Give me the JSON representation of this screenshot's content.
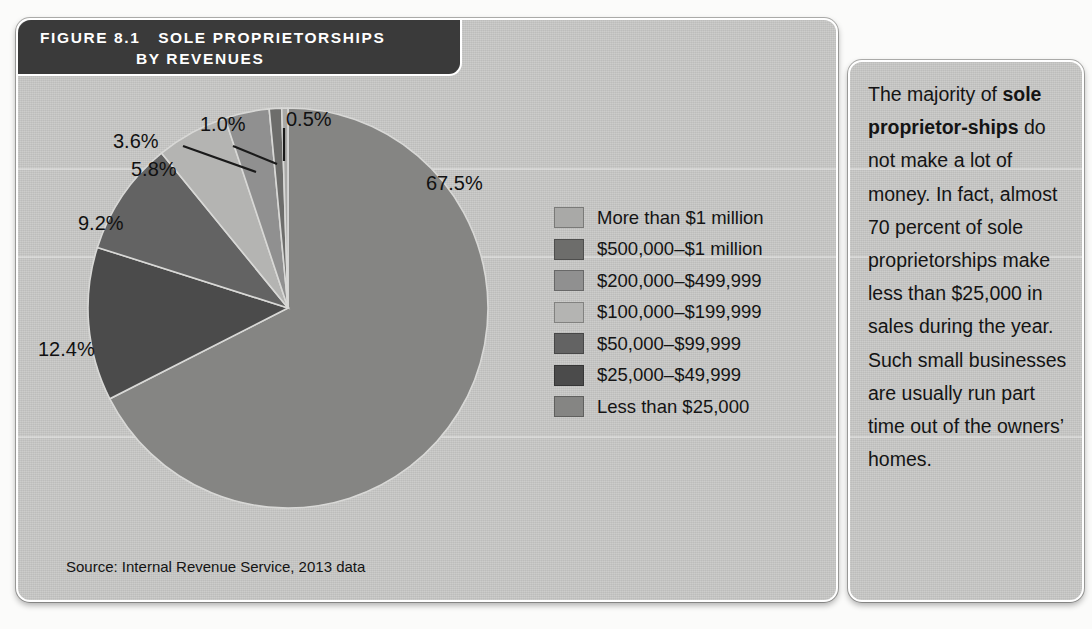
{
  "figure": {
    "label": "FIGURE 8.1",
    "title_line1": "SOLE PROPRIETORSHIPS",
    "title_line2": "BY REVENUES",
    "source": "Source: Internal Revenue Service, 2013 data"
  },
  "caption": {
    "part1": "The majority of ",
    "bold": "sole proprietor-ships",
    "part2": " do not make a lot of money. In fact, almost 70 percent of sole proprietorships make less than $25,000 in sales during the year. Such small businesses are usually run part time out of the owners’ homes."
  },
  "chart_data": {
    "type": "pie",
    "source": "Source: Internal Revenue Service, 2013 data",
    "legend_position": "right",
    "unit": "percent",
    "categories": [
      "More than $1 million",
      "$500,000–$1 million",
      "$200,000–$499,999",
      "$100,000–$199,999",
      "$50,000–$99,999",
      "$25,000–$49,999",
      "Less than $25,000"
    ],
    "values": [
      0.5,
      1.0,
      3.6,
      5.8,
      9.2,
      12.4,
      67.5
    ],
    "labels": [
      "0.5%",
      "1.0%",
      "3.6%",
      "5.8%",
      "9.2%",
      "12.4%",
      "67.5%"
    ],
    "colors": [
      "#a9a9a7",
      "#6d6d6b",
      "#909090",
      "#b4b4b2",
      "#636363",
      "#4b4b4b",
      "#858583"
    ],
    "slice_order_clockwise_from_top": [
      {
        "category": "Less than $25,000",
        "value": 67.5,
        "color": "#858583"
      },
      {
        "category": "$25,000–$49,999",
        "value": 12.4,
        "color": "#4b4b4b"
      },
      {
        "category": "$50,000–$99,999",
        "value": 9.2,
        "color": "#636363"
      },
      {
        "category": "$100,000–$199,999",
        "value": 5.8,
        "color": "#b4b4b2"
      },
      {
        "category": "$200,000–$499,999",
        "value": 3.6,
        "color": "#909090"
      },
      {
        "category": "$500,000–$1 million",
        "value": 1.0,
        "color": "#6d6d6b"
      },
      {
        "category": "More than $1 million",
        "value": 0.5,
        "color": "#a9a9a7"
      }
    ]
  },
  "legend": [
    {
      "label": "More than $1 million",
      "color": "#a9a9a7"
    },
    {
      "label": "$500,000–$1 million",
      "color": "#6d6d6b"
    },
    {
      "label": "$200,000–$499,999",
      "color": "#909090"
    },
    {
      "label": "$100,000–$199,999",
      "color": "#b4b4b2"
    },
    {
      "label": "$50,000–$99,999",
      "color": "#636363"
    },
    {
      "label": "$25,000–$49,999",
      "color": "#4b4b4b"
    },
    {
      "label": "Less than $25,000",
      "color": "#858583"
    }
  ],
  "percent_labels": {
    "p0_5": "0.5%",
    "p1_0": "1.0%",
    "p3_6": "3.6%",
    "p5_8": "5.8%",
    "p9_2": "9.2%",
    "p12_4": "12.4%",
    "p67_5": "67.5%"
  }
}
